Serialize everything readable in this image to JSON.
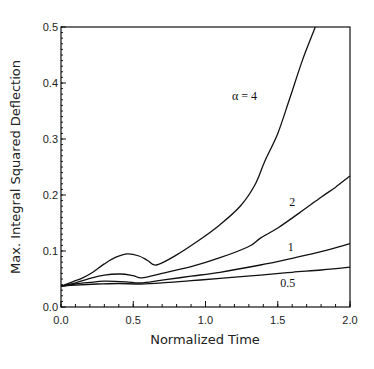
{
  "chart_data": {
    "type": "line",
    "title": "",
    "xlabel": "Normalized Time",
    "ylabel": "Max. Integral Squared Deflection",
    "xlim": [
      0.0,
      2.0
    ],
    "ylim": [
      0.0,
      0.5
    ],
    "grid": false,
    "x_ticks": [
      0.0,
      0.5,
      1.0,
      1.5,
      2.0
    ],
    "x_tick_labels": [
      "0.0",
      "0.5",
      "1.0",
      "1.5",
      "2.0"
    ],
    "y_ticks": [
      0.0,
      0.1,
      0.2,
      0.3,
      0.4,
      0.5
    ],
    "y_tick_labels": [
      "0.0",
      "0.1",
      "0.2",
      "0.3",
      "0.4",
      "0.5"
    ],
    "x_minor_step": 0.1,
    "y_minor_step": 0.01,
    "series": [
      {
        "name": "α = 4",
        "label": "α = 4",
        "label_at": [
          1.27,
          0.37
        ],
        "points": [
          [
            0.0,
            0.037
          ],
          [
            0.08,
            0.045
          ],
          [
            0.15,
            0.052
          ],
          [
            0.22,
            0.062
          ],
          [
            0.3,
            0.077
          ],
          [
            0.38,
            0.089
          ],
          [
            0.46,
            0.095
          ],
          [
            0.54,
            0.091
          ],
          [
            0.6,
            0.083
          ],
          [
            0.66,
            0.075
          ],
          [
            0.8,
            0.093
          ],
          [
            0.96,
            0.12
          ],
          [
            1.1,
            0.147
          ],
          [
            1.24,
            0.18
          ],
          [
            1.34,
            0.217
          ],
          [
            1.41,
            0.26
          ],
          [
            1.5,
            0.31
          ],
          [
            1.58,
            0.37
          ],
          [
            1.67,
            0.44
          ],
          [
            1.76,
            0.5
          ]
        ]
      },
      {
        "name": "2",
        "label": "2",
        "label_at": [
          1.6,
          0.18
        ],
        "points": [
          [
            0.0,
            0.037
          ],
          [
            0.1,
            0.043
          ],
          [
            0.2,
            0.051
          ],
          [
            0.3,
            0.057
          ],
          [
            0.41,
            0.059
          ],
          [
            0.5,
            0.056
          ],
          [
            0.56,
            0.052
          ],
          [
            0.7,
            0.06
          ],
          [
            0.9,
            0.072
          ],
          [
            1.1,
            0.088
          ],
          [
            1.3,
            0.108
          ],
          [
            1.38,
            0.123
          ],
          [
            1.5,
            0.141
          ],
          [
            1.65,
            0.168
          ],
          [
            1.8,
            0.196
          ],
          [
            1.9,
            0.214
          ],
          [
            2.0,
            0.234
          ]
        ]
      },
      {
        "name": "1",
        "label": "1",
        "label_at": [
          1.59,
          0.1
        ],
        "points": [
          [
            0.0,
            0.037
          ],
          [
            0.1,
            0.041
          ],
          [
            0.2,
            0.044
          ],
          [
            0.3,
            0.046
          ],
          [
            0.45,
            0.045
          ],
          [
            0.55,
            0.043
          ],
          [
            0.7,
            0.048
          ],
          [
            0.9,
            0.055
          ],
          [
            1.1,
            0.062
          ],
          [
            1.38,
            0.075
          ],
          [
            1.6,
            0.087
          ],
          [
            1.8,
            0.099
          ],
          [
            2.0,
            0.113
          ]
        ]
      },
      {
        "name": "0.5",
        "label": "0.5",
        "label_at": [
          1.57,
          0.035
        ],
        "points": [
          [
            0.0,
            0.037
          ],
          [
            0.1,
            0.039
          ],
          [
            0.25,
            0.041
          ],
          [
            0.4,
            0.042
          ],
          [
            0.55,
            0.041
          ],
          [
            0.7,
            0.043
          ],
          [
            0.9,
            0.047
          ],
          [
            1.1,
            0.051
          ],
          [
            1.38,
            0.057
          ],
          [
            1.6,
            0.062
          ],
          [
            1.8,
            0.066
          ],
          [
            2.0,
            0.071
          ]
        ]
      }
    ]
  }
}
